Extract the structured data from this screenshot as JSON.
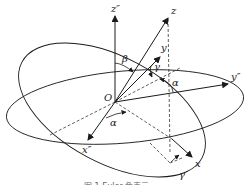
{
  "diagram": {
    "origin_label": "O",
    "axes": [
      {
        "id": "z2",
        "label": "z″"
      },
      {
        "id": "z",
        "label": "z"
      },
      {
        "id": "y",
        "label": "y"
      },
      {
        "id": "y2",
        "label": "y″"
      },
      {
        "id": "x2",
        "label": "x″"
      },
      {
        "id": "x",
        "label": "x"
      }
    ],
    "angles": [
      {
        "id": "beta",
        "label": "β"
      },
      {
        "id": "gamma_top",
        "label": "γ"
      },
      {
        "id": "alpha_right",
        "label": "α"
      },
      {
        "id": "alpha_left",
        "label": "α"
      },
      {
        "id": "gamma_bottom",
        "label": "γ"
      }
    ],
    "caption": "图 1  Euler 角表示"
  },
  "colors": {
    "stroke": "#1a1a1a",
    "background": "#ffffff"
  }
}
